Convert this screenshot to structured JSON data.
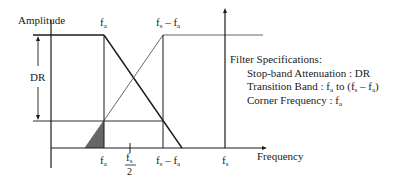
{
  "diagram": {
    "y_axis_label": "Amplitude",
    "x_axis_label": "Frequency",
    "dr_label": "DR",
    "top_labels": {
      "fa": {
        "base": "f",
        "sub": "a"
      },
      "fs_minus_fa": {
        "base1": "f",
        "sub1": "s",
        "minus": " – ",
        "base2": "f",
        "sub2": "a"
      }
    },
    "bottom_labels": {
      "fa": {
        "base": "f",
        "sub": "a"
      },
      "fs_half": {
        "num_base": "f",
        "num_sub": "s",
        "den": "2"
      },
      "fs_minus_fa": {
        "base1": "f",
        "sub1": "s",
        "minus": " – ",
        "base2": "f",
        "sub2": "a"
      },
      "fs": {
        "base": "f",
        "sub": "s"
      }
    },
    "colors": {
      "line": "#1a1a1a",
      "thin_line": "#555555",
      "shaded": "#666666"
    }
  },
  "specs": {
    "title": "Filter Specifications:",
    "stopband_label": "Stop-band Attenuation : DR",
    "transition_prefix": "Transition Band : ",
    "transition_f1": "f",
    "transition_s1": "a",
    "transition_mid": " to (",
    "transition_f2": "f",
    "transition_s2": "s",
    "transition_minus": " – ",
    "transition_f3": "f",
    "transition_s3": "a",
    "transition_end": ")",
    "corner_prefix": "Corner Frequency : ",
    "corner_f": "f",
    "corner_s": "a"
  }
}
